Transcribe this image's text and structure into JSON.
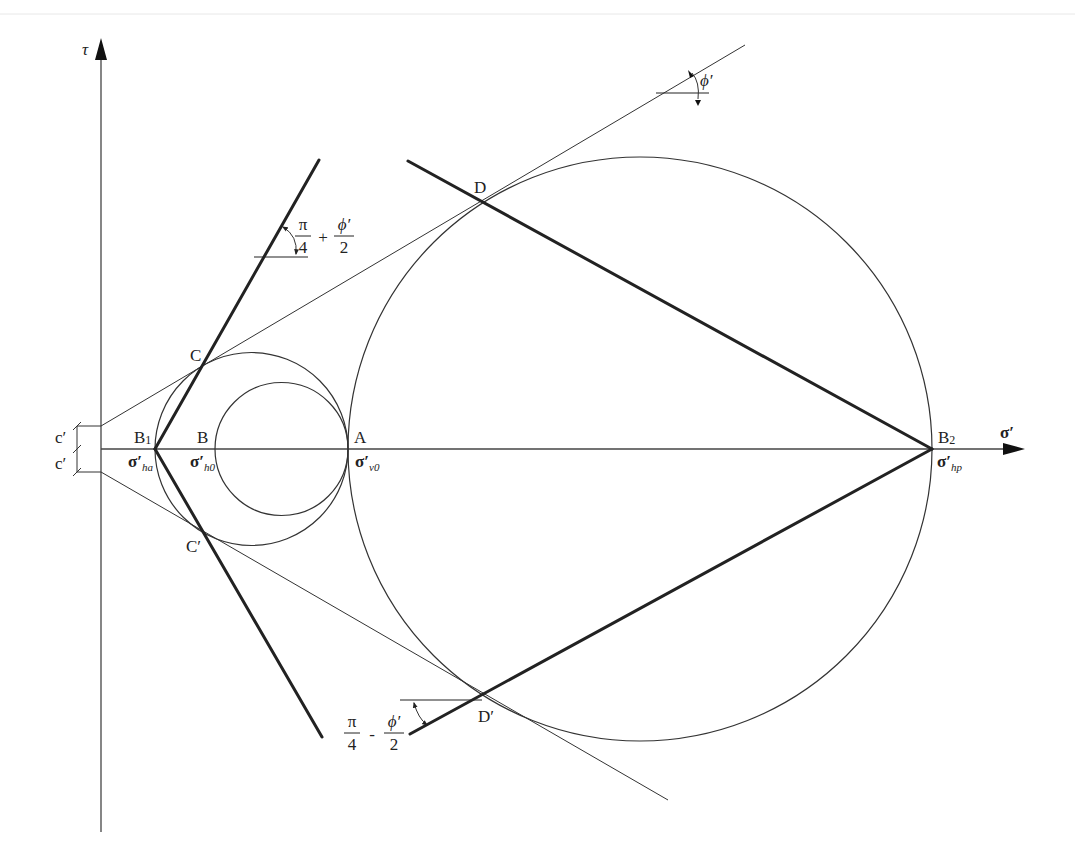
{
  "diagram": {
    "axes": {
      "y_label": "τ",
      "x_label": "σ′"
    },
    "points": {
      "B1": {
        "label": "B",
        "sub": "1",
        "stress": "σ′",
        "stress_sub": "ha"
      },
      "B": {
        "label": "B",
        "stress": "σ′",
        "stress_sub": "h0"
      },
      "A": {
        "label": "A",
        "stress": "σ′",
        "stress_sub": "v0"
      },
      "B2": {
        "label": "B",
        "sub": "2",
        "stress": "σ′",
        "stress_sub": "hp"
      },
      "C": {
        "label": "C"
      },
      "C_prime": {
        "label": "C′"
      },
      "D": {
        "label": "D"
      },
      "D_prime": {
        "label": "D′"
      }
    },
    "cohesion": {
      "upper": "c′",
      "lower": "c′"
    },
    "angles": {
      "active": {
        "num1": "π",
        "den1": "4",
        "op": "+",
        "num2": "ϕ′",
        "den2": "2"
      },
      "passive": {
        "num1": "π",
        "den1": "4",
        "op": "-",
        "num2": "ϕ′",
        "den2": "2"
      },
      "friction": "ϕ′"
    },
    "colors": {
      "line": "#333333",
      "thick_line": "#222222",
      "background": "#ffffff"
    }
  }
}
